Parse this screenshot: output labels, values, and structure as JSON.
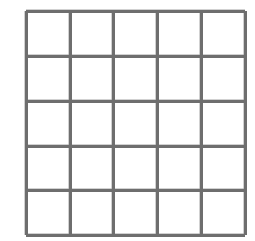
{
  "figure": {
    "background_color": "#ffffff",
    "line_color": "#6e6e6e",
    "line_color_soft": "#9a9a9a",
    "line_width_px": 3,
    "rows": 5,
    "columns": 5,
    "cell_count": 25,
    "cell_fill_color": "#ffffff",
    "x_positions": [
      26,
      70,
      113,
      157,
      201,
      245
    ],
    "y_positions": [
      11,
      56,
      101,
      146,
      190,
      235
    ],
    "cell_labels": [
      [
        "",
        "",
        "",
        "",
        ""
      ],
      [
        "",
        "",
        "",
        "",
        ""
      ],
      [
        "",
        "",
        "",
        "",
        ""
      ],
      [
        "",
        "",
        "",
        "",
        ""
      ],
      [
        "",
        "",
        "",
        "",
        ""
      ]
    ]
  }
}
